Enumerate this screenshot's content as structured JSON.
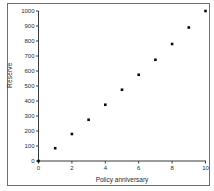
{
  "chart": {
    "y_axis_title": "Reserve",
    "x_axis_title": "Policy anniversary"
  },
  "chart_data": {
    "type": "scatter",
    "title": "",
    "xlabel": "Policy anniversary",
    "ylabel": "Reserve",
    "x": [
      0,
      1,
      2,
      3,
      4,
      5,
      6,
      7,
      8,
      9,
      10
    ],
    "y": [
      0,
      85,
      180,
      275,
      375,
      475,
      575,
      675,
      780,
      890,
      1000
    ],
    "xlim": [
      0,
      10
    ],
    "ylim": [
      0,
      1000
    ],
    "x_ticks": [
      0,
      2,
      4,
      6,
      8,
      10
    ],
    "y_ticks": [
      0,
      100,
      200,
      300,
      400,
      500,
      600,
      700,
      800,
      900,
      1000
    ],
    "grid": false,
    "legend": "none",
    "marker": "square",
    "marker_color": "#0a0a0a",
    "axis_color": "#3a3a3a",
    "frame_color": "#6e6e6e"
  }
}
